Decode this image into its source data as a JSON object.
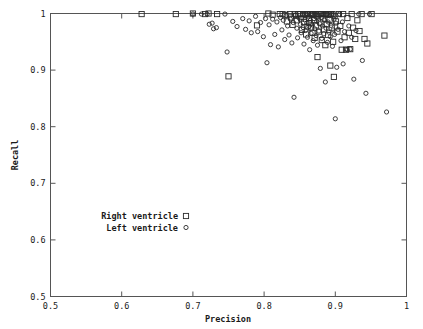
{
  "chart_data": {
    "type": "scatter",
    "title": "",
    "xlabel": "Precision",
    "ylabel": "Recall",
    "xlim": [
      0.5,
      1.0
    ],
    "ylim": [
      0.5,
      1.0
    ],
    "xticks": [
      "0.5",
      "0.6",
      "0.7",
      "0.8",
      "0.9",
      "1"
    ],
    "xtick_values": [
      0.5,
      0.6,
      0.7,
      0.8,
      0.9,
      1.0
    ],
    "yticks": [
      "0.5",
      "0.6",
      "0.7",
      "0.8",
      "0.9",
      "1"
    ],
    "ytick_values": [
      0.5,
      0.6,
      0.7,
      0.8,
      0.9,
      1.0
    ],
    "grid": false,
    "legend_position": "center-left",
    "series": [
      {
        "name": "Right ventricle",
        "marker": "square",
        "points": [
          [
            0.628,
            0.999
          ],
          [
            0.676,
            0.999
          ],
          [
            0.7,
            1.0
          ],
          [
            0.717,
            0.999
          ],
          [
            0.722,
            1.0
          ],
          [
            0.734,
            0.999
          ],
          [
            0.75,
            0.889
          ],
          [
            0.79,
            0.979
          ],
          [
            0.806,
            1.0
          ],
          [
            0.812,
            0.998
          ],
          [
            0.822,
            0.999
          ],
          [
            0.826,
            0.999
          ],
          [
            0.83,
            0.997
          ],
          [
            0.832,
            0.986
          ],
          [
            0.836,
            0.999
          ],
          [
            0.838,
            0.993
          ],
          [
            0.84,
            0.98
          ],
          [
            0.843,
            0.999
          ],
          [
            0.845,
            0.996
          ],
          [
            0.846,
            0.988
          ],
          [
            0.848,
            0.999
          ],
          [
            0.85,
            0.999
          ],
          [
            0.852,
            0.991
          ],
          [
            0.853,
            0.971
          ],
          [
            0.855,
            0.999
          ],
          [
            0.856,
            0.985
          ],
          [
            0.858,
            0.998
          ],
          [
            0.859,
            0.963
          ],
          [
            0.86,
            0.999
          ],
          [
            0.861,
            0.977
          ],
          [
            0.862,
            0.999
          ],
          [
            0.863,
            0.992
          ],
          [
            0.864,
            0.983
          ],
          [
            0.865,
            0.999
          ],
          [
            0.866,
            0.975
          ],
          [
            0.867,
            0.998
          ],
          [
            0.868,
            0.966
          ],
          [
            0.869,
            0.999
          ],
          [
            0.87,
            0.988
          ],
          [
            0.871,
            0.957
          ],
          [
            0.872,
            0.999
          ],
          [
            0.873,
            0.979
          ],
          [
            0.874,
            0.996
          ],
          [
            0.875,
            0.923
          ],
          [
            0.876,
            0.999
          ],
          [
            0.877,
            0.968
          ],
          [
            0.878,
            0.999
          ],
          [
            0.879,
            0.984
          ],
          [
            0.88,
            0.999
          ],
          [
            0.881,
            0.953
          ],
          [
            0.882,
            0.999
          ],
          [
            0.883,
            0.991
          ],
          [
            0.884,
            0.972
          ],
          [
            0.885,
            0.999
          ],
          [
            0.886,
            0.944
          ],
          [
            0.887,
            0.998
          ],
          [
            0.888,
            0.981
          ],
          [
            0.889,
            0.999
          ],
          [
            0.89,
            0.962
          ],
          [
            0.891,
            0.999
          ],
          [
            0.892,
            0.989
          ],
          [
            0.893,
            0.908
          ],
          [
            0.894,
            0.999
          ],
          [
            0.895,
            0.975
          ],
          [
            0.896,
            0.999
          ],
          [
            0.897,
            0.95
          ],
          [
            0.898,
            0.888
          ],
          [
            0.899,
            0.996
          ],
          [
            0.901,
            0.986
          ],
          [
            0.903,
            0.968
          ],
          [
            0.905,
            0.999
          ],
          [
            0.907,
            0.978
          ],
          [
            0.909,
            0.936
          ],
          [
            0.911,
            0.999
          ],
          [
            0.913,
            0.958
          ],
          [
            0.915,
            0.936
          ],
          [
            0.917,
            0.992
          ],
          [
            0.919,
            0.966
          ],
          [
            0.921,
            0.937
          ],
          [
            0.923,
            0.999
          ],
          [
            0.925,
            0.975
          ],
          [
            0.928,
            0.955
          ],
          [
            0.931,
            0.988
          ],
          [
            0.934,
            0.969
          ],
          [
            0.937,
            0.999
          ],
          [
            0.941,
            0.955
          ],
          [
            0.945,
            0.947
          ],
          [
            0.951,
            0.999
          ],
          [
            0.969,
            0.961
          ]
        ]
      },
      {
        "name": "Left ventricle",
        "marker": "circle",
        "points": [
          [
            0.7,
            0.999
          ],
          [
            0.712,
            0.999
          ],
          [
            0.72,
            0.999
          ],
          [
            0.723,
            0.981
          ],
          [
            0.727,
            0.983
          ],
          [
            0.729,
            0.973
          ],
          [
            0.733,
            0.975
          ],
          [
            0.745,
            0.999
          ],
          [
            0.748,
            0.932
          ],
          [
            0.756,
            0.986
          ],
          [
            0.762,
            0.977
          ],
          [
            0.77,
            0.991
          ],
          [
            0.774,
            0.972
          ],
          [
            0.779,
            0.987
          ],
          [
            0.782,
            0.966
          ],
          [
            0.788,
            0.995
          ],
          [
            0.791,
            0.968
          ],
          [
            0.795,
            0.984
          ],
          [
            0.799,
            0.959
          ],
          [
            0.802,
            0.991
          ],
          [
            0.804,
            0.913
          ],
          [
            0.807,
            0.98
          ],
          [
            0.809,
            0.945
          ],
          [
            0.812,
            0.99
          ],
          [
            0.815,
            0.963
          ],
          [
            0.818,
            0.985
          ],
          [
            0.82,
            0.941
          ],
          [
            0.823,
            0.993
          ],
          [
            0.825,
            0.971
          ],
          [
            0.827,
            0.988
          ],
          [
            0.829,
            0.954
          ],
          [
            0.831,
            0.996
          ],
          [
            0.833,
            0.978
          ],
          [
            0.835,
            0.962
          ],
          [
            0.837,
            0.99
          ],
          [
            0.839,
            0.948
          ],
          [
            0.841,
            0.984
          ],
          [
            0.842,
            0.852
          ],
          [
            0.844,
            0.997
          ],
          [
            0.846,
            0.974
          ],
          [
            0.847,
            0.957
          ],
          [
            0.849,
            0.992
          ],
          [
            0.851,
            0.981
          ],
          [
            0.852,
            0.966
          ],
          [
            0.854,
            0.999
          ],
          [
            0.855,
            0.975
          ],
          [
            0.856,
            0.946
          ],
          [
            0.857,
            0.989
          ],
          [
            0.858,
            0.97
          ],
          [
            0.859,
            0.999
          ],
          [
            0.86,
            0.983
          ],
          [
            0.861,
            0.958
          ],
          [
            0.862,
            0.994
          ],
          [
            0.863,
            0.977
          ],
          [
            0.864,
            0.936
          ],
          [
            0.865,
            0.988
          ],
          [
            0.866,
            0.965
          ],
          [
            0.867,
            0.999
          ],
          [
            0.868,
            0.98
          ],
          [
            0.869,
            0.952
          ],
          [
            0.87,
            0.991
          ],
          [
            0.871,
            0.973
          ],
          [
            0.872,
            0.999
          ],
          [
            0.873,
            0.961
          ],
          [
            0.874,
            0.986
          ],
          [
            0.875,
            0.944
          ],
          [
            0.876,
            0.997
          ],
          [
            0.877,
            0.969
          ],
          [
            0.878,
            0.982
          ],
          [
            0.879,
            0.903
          ],
          [
            0.88,
            0.993
          ],
          [
            0.881,
            0.956
          ],
          [
            0.882,
            0.978
          ],
          [
            0.883,
            0.999
          ],
          [
            0.884,
            0.964
          ],
          [
            0.885,
            0.988
          ],
          [
            0.886,
            0.879
          ],
          [
            0.887,
            0.974
          ],
          [
            0.888,
            0.999
          ],
          [
            0.889,
            0.949
          ],
          [
            0.89,
            0.985
          ],
          [
            0.891,
            0.967
          ],
          [
            0.892,
            0.996
          ],
          [
            0.893,
            0.959
          ],
          [
            0.894,
            0.979
          ],
          [
            0.895,
            0.999
          ],
          [
            0.896,
            0.942
          ],
          [
            0.897,
            0.971
          ],
          [
            0.898,
            0.99
          ],
          [
            0.899,
            0.963
          ],
          [
            0.9,
            0.814
          ],
          [
            0.901,
            0.983
          ],
          [
            0.902,
            0.905
          ],
          [
            0.904,
            0.972
          ],
          [
            0.906,
            0.999
          ],
          [
            0.908,
            0.952
          ],
          [
            0.91,
            0.985
          ],
          [
            0.911,
            0.911
          ],
          [
            0.913,
            0.968
          ],
          [
            0.915,
            0.937
          ],
          [
            0.917,
            0.936
          ],
          [
            0.919,
            0.978
          ],
          [
            0.921,
            0.937
          ],
          [
            0.923,
            0.958
          ],
          [
            0.926,
            0.884
          ],
          [
            0.929,
            0.97
          ],
          [
            0.933,
            0.999
          ],
          [
            0.938,
            0.917
          ],
          [
            0.943,
            0.859
          ],
          [
            0.948,
            0.999
          ],
          [
            0.972,
            0.826
          ]
        ]
      }
    ]
  },
  "legend": {
    "entries": [
      {
        "label": "Right ventricle",
        "marker": "square"
      },
      {
        "label": "Left ventricle",
        "marker": "circle"
      }
    ]
  }
}
